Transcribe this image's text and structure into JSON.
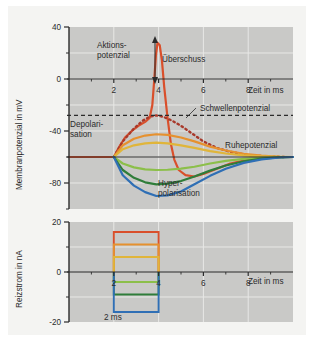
{
  "figure": {
    "background_color": "#f3f3f1",
    "plot_background_color": "#c9c9c7",
    "grid_color": "#e8e8e6",
    "axis_color": "#2b2b2b"
  },
  "chart_data": [
    {
      "id": "membrane-potential",
      "type": "line",
      "title": "",
      "xlabel": "Zeit in ms",
      "ylabel": "Membranpotenzial in mV",
      "xlim": [
        0,
        10
      ],
      "ylim": [
        -100,
        40
      ],
      "xticks": [
        2,
        4,
        6,
        8
      ],
      "xtick_labels": [
        "2",
        "4",
        "6",
        "8"
      ],
      "yticks": [
        40,
        0,
        -40,
        -80
      ],
      "ytick_labels": [
        "40",
        "0",
        "-40",
        "-80"
      ],
      "yminor_ticks": [
        20,
        -20,
        -60,
        -100
      ],
      "grid": true,
      "legend": "none",
      "reference_lines": [
        {
          "name": "Ruhepotenzial",
          "value": -60,
          "style": "solid",
          "color": "#2b2b2b"
        },
        {
          "name": "Schwellenpotenzial",
          "value": -28,
          "style": "dashed",
          "color": "#2b2b2b"
        },
        {
          "name": "Nulllinie",
          "value": 0,
          "style": "solid",
          "color": "#2b2b2b"
        }
      ],
      "series": [
        {
          "name": "Überschwelliger Reiz (Aktionspotenzial)",
          "color": "#d94f2b",
          "stimulus_nA": 16,
          "peak_mV": 28,
          "peak_time_ms": 3.95,
          "points": [
            [
              0,
              -60
            ],
            [
              1.0,
              -60
            ],
            [
              1.8,
              -60
            ],
            [
              2.0,
              -60
            ],
            [
              2.25,
              -52
            ],
            [
              2.5,
              -45
            ],
            [
              2.8,
              -40
            ],
            [
              3.1,
              -36
            ],
            [
              3.4,
              -33
            ],
            [
              3.6,
              -30
            ],
            [
              3.72,
              -20
            ],
            [
              3.8,
              -2
            ],
            [
              3.88,
              18
            ],
            [
              3.95,
              28
            ],
            [
              4.05,
              26
            ],
            [
              4.15,
              14
            ],
            [
              4.25,
              -6
            ],
            [
              4.4,
              -30
            ],
            [
              4.55,
              -50
            ],
            [
              4.7,
              -62
            ],
            [
              4.9,
              -70
            ],
            [
              5.2,
              -74
            ],
            [
              5.6,
              -75
            ],
            [
              6.0,
              -73
            ],
            [
              6.6,
              -69
            ],
            [
              7.2,
              -65
            ],
            [
              8.0,
              -62
            ],
            [
              8.8,
              -60.5
            ],
            [
              9.6,
              -60
            ],
            [
              10,
              -60
            ]
          ]
        },
        {
          "name": "Schwellenreiz (abgebrochene Depolarisation)",
          "color": "#a8392b",
          "style": "dotted",
          "stimulus_nA": 14,
          "points": [
            [
              2.0,
              -60
            ],
            [
              2.4,
              -48
            ],
            [
              2.9,
              -38
            ],
            [
              3.3,
              -32
            ],
            [
              3.6,
              -29
            ],
            [
              3.9,
              -28
            ],
            [
              4.2,
              -29
            ],
            [
              4.6,
              -32
            ],
            [
              5.0,
              -36
            ],
            [
              5.5,
              -42
            ],
            [
              6.0,
              -48
            ],
            [
              6.6,
              -53
            ],
            [
              7.2,
              -56
            ],
            [
              8.0,
              -58.5
            ],
            [
              8.8,
              -59.6
            ],
            [
              9.6,
              -60
            ]
          ]
        },
        {
          "name": "Unterschwelliger Reiz (stark)",
          "color": "#e6912f",
          "stimulus_nA": 11,
          "peak_mV": -42,
          "points": [
            [
              2.0,
              -60
            ],
            [
              2.4,
              -51
            ],
            [
              2.9,
              -46
            ],
            [
              3.4,
              -43.5
            ],
            [
              3.9,
              -42.5
            ],
            [
              4.4,
              -43
            ],
            [
              5.0,
              -45
            ],
            [
              5.6,
              -48
            ],
            [
              6.3,
              -52
            ],
            [
              7.0,
              -55
            ],
            [
              7.8,
              -57.5
            ],
            [
              8.6,
              -59
            ],
            [
              9.4,
              -59.8
            ],
            [
              10,
              -60
            ]
          ]
        },
        {
          "name": "Unterschwelliger Reiz (mittel)",
          "color": "#e0b53a",
          "stimulus_nA": 6,
          "peak_mV": -49,
          "points": [
            [
              2.0,
              -60
            ],
            [
              2.4,
              -54
            ],
            [
              2.9,
              -51
            ],
            [
              3.4,
              -49.5
            ],
            [
              3.9,
              -49
            ],
            [
              4.4,
              -49.5
            ],
            [
              5.0,
              -51
            ],
            [
              5.6,
              -53
            ],
            [
              6.3,
              -55.5
            ],
            [
              7.0,
              -57.3
            ],
            [
              7.8,
              -58.8
            ],
            [
              8.6,
              -59.5
            ],
            [
              9.4,
              -59.9
            ],
            [
              10,
              -60
            ]
          ]
        },
        {
          "name": "Hyperpolarisation (schwach)",
          "color": "#8cbf4a",
          "stimulus_nA": -4,
          "trough_mV": -70,
          "points": [
            [
              2.0,
              -60
            ],
            [
              2.4,
              -65
            ],
            [
              2.9,
              -68
            ],
            [
              3.4,
              -69.5
            ],
            [
              3.9,
              -70
            ],
            [
              4.4,
              -69.8
            ],
            [
              5.0,
              -69
            ],
            [
              5.6,
              -67.5
            ],
            [
              6.3,
              -65
            ],
            [
              7.0,
              -63
            ],
            [
              7.8,
              -61.5
            ],
            [
              8.6,
              -60.6
            ],
            [
              9.4,
              -60.1
            ],
            [
              10,
              -60
            ]
          ]
        },
        {
          "name": "Hyperpolarisation (mittel)",
          "color": "#2f7d3a",
          "stimulus_nA": -9,
          "trough_mV": -81,
          "points": [
            [
              2.0,
              -60
            ],
            [
              2.4,
              -70
            ],
            [
              2.9,
              -76
            ],
            [
              3.4,
              -79.5
            ],
            [
              3.9,
              -81
            ],
            [
              4.4,
              -80.5
            ],
            [
              5.0,
              -78.5
            ],
            [
              5.6,
              -75
            ],
            [
              6.3,
              -70.5
            ],
            [
              7.0,
              -66.5
            ],
            [
              7.8,
              -63.3
            ],
            [
              8.6,
              -61.3
            ],
            [
              9.4,
              -60.3
            ],
            [
              10,
              -60
            ]
          ]
        },
        {
          "name": "Hyperpolarisation (stark)",
          "color": "#2f6fb5",
          "stimulus_nA": -16,
          "trough_mV": -90,
          "points": [
            [
              2.0,
              -60
            ],
            [
              2.4,
              -74
            ],
            [
              2.9,
              -82
            ],
            [
              3.4,
              -87
            ],
            [
              3.9,
              -90
            ],
            [
              4.4,
              -89.5
            ],
            [
              5.0,
              -86.5
            ],
            [
              5.6,
              -81
            ],
            [
              6.3,
              -74.5
            ],
            [
              7.0,
              -69
            ],
            [
              7.8,
              -64.5
            ],
            [
              8.6,
              -61.8
            ],
            [
              9.4,
              -60.4
            ],
            [
              10,
              -60
            ]
          ]
        }
      ],
      "annotations": [
        {
          "name": "Aktionspotenzial",
          "text_line1": "Aktions-",
          "text_line2": "potenzial"
        },
        {
          "name": "Überschuss",
          "text": "Überschuss",
          "arrow_from_mV": 0,
          "arrow_to_mV": 28
        },
        {
          "name": "Schwellenpotenzial",
          "text": "Schwellenpotenzial",
          "value_mV": -28
        },
        {
          "name": "Depolarisation",
          "text_line1": "Depolari-",
          "text_line2": "sation"
        },
        {
          "name": "Ruhepotenzial",
          "text": "Ruhepotenzial",
          "value_mV": -60
        },
        {
          "name": "Hyperpolarisation",
          "text_line1": "Hyper-",
          "text_line2": "polarisation"
        }
      ]
    },
    {
      "id": "stimulus-current",
      "type": "bar",
      "title": "",
      "xlabel": "Zeit in ms",
      "ylabel": "Reizstrom in nA",
      "xlim": [
        0,
        10
      ],
      "ylim": [
        -20,
        20
      ],
      "xticks": [
        2,
        4,
        6,
        8
      ],
      "xtick_labels": [
        "2",
        "4",
        "6",
        "8"
      ],
      "yticks": [
        20,
        0,
        -20
      ],
      "ytick_labels": [
        "20",
        "0",
        "-20"
      ],
      "yminor_ticks": [
        10,
        -10
      ],
      "grid": true,
      "legend": "none",
      "pulse_start_ms": 2,
      "pulse_end_ms": 4,
      "duration_label": "2 ms",
      "pulses": [
        {
          "name": "überschwellig",
          "amplitude_nA": 16,
          "color": "#d94f2b"
        },
        {
          "name": "schwellennah",
          "amplitude_nA": 11,
          "color": "#e6912f"
        },
        {
          "name": "unterschwellig",
          "amplitude_nA": 6,
          "color": "#e0b53a"
        },
        {
          "name": "hyperpolarisierend-schwach",
          "amplitude_nA": -4,
          "color": "#8cbf4a"
        },
        {
          "name": "hyperpolarisierend-mittel",
          "amplitude_nA": -9,
          "color": "#2f7d3a"
        },
        {
          "name": "hyperpolarisierend-stark",
          "amplitude_nA": -16,
          "color": "#2f6fb5"
        }
      ]
    }
  ]
}
